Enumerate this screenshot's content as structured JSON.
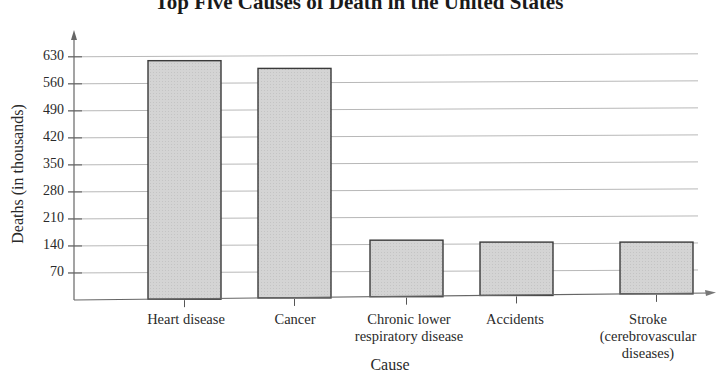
{
  "chart_data": {
    "type": "bar",
    "title": "Top Five Causes of Death in the United States",
    "xlabel": "Cause",
    "ylabel": "Deaths (in thousands)",
    "categories": [
      "Heart disease",
      "Cancer",
      "Chronic lower respiratory disease",
      "Accidents",
      "Stroke (cerebrovascular diseases)"
    ],
    "category_lines": [
      [
        "Heart disease"
      ],
      [
        "Cancer"
      ],
      [
        "Chronic lower",
        "respiratory disease"
      ],
      [
        "Accidents"
      ],
      [
        "Stroke",
        "(cerebrovascular",
        "diseases)"
      ]
    ],
    "values": [
      620,
      600,
      155,
      150,
      150
    ],
    "yticks": [
      70,
      140,
      210,
      280,
      350,
      420,
      490,
      560,
      630
    ],
    "ylim": [
      0,
      650
    ],
    "grid": true,
    "legend": null,
    "bar_color": "#d6d6d6",
    "bar_edge_color": "#3a3a3a"
  }
}
